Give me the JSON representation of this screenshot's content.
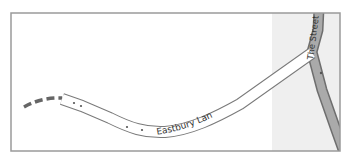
{
  "map": {
    "roads": [
      {
        "name": "Eastbury Lane",
        "label": "Eastbury Lane",
        "type": "minor-road"
      },
      {
        "name": "The Street",
        "label": "The Street",
        "type": "secondary-road"
      }
    ],
    "footpath": {
      "type": "dashed-track"
    },
    "colors": {
      "background": "#ffffff",
      "shaded_area": "#eeeeee",
      "frame_border": "#999999",
      "minor_road_fill": "#ffffff",
      "minor_road_casing": "#7a7a7a",
      "secondary_road_fill": "#aaaaaa",
      "secondary_road_casing": "#6e6e6e",
      "footpath": "#666666",
      "label_text": "#333333"
    }
  }
}
